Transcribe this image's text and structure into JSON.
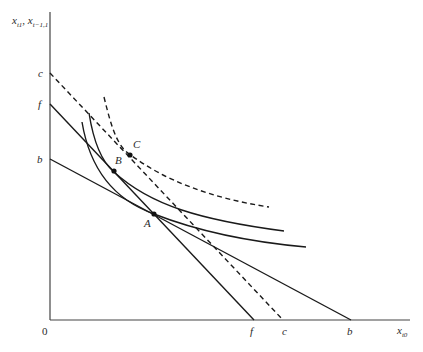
{
  "diagram": {
    "type": "economics-indifference-budget",
    "y_axis_label": {
      "main": "x",
      "sub1": "t1",
      "sep": ", ",
      "main2": "x",
      "sub2": "t−1,1"
    },
    "x_axis_label": {
      "main": "x",
      "sub": "t0"
    },
    "origin_label": "0",
    "y_intercepts": [
      {
        "label": "c",
        "style": "dashed"
      },
      {
        "label": "f",
        "style": "solid"
      },
      {
        "label": "b",
        "style": "solid"
      }
    ],
    "x_intercepts": [
      {
        "label": "f",
        "style": "solid"
      },
      {
        "label": "c",
        "style": "dashed"
      },
      {
        "label": "b",
        "style": "solid"
      }
    ],
    "points": [
      {
        "label": "A"
      },
      {
        "label": "B"
      },
      {
        "label": "C"
      }
    ],
    "lines": [
      {
        "name": "budget-line-cc",
        "from": "c",
        "to": "c",
        "style": "dashed"
      },
      {
        "name": "budget-line-ff",
        "from": "f",
        "to": "f",
        "style": "solid"
      },
      {
        "name": "budget-line-bb",
        "from": "b",
        "to": "b",
        "style": "solid"
      }
    ],
    "curves": [
      {
        "name": "indifference-curve-upper",
        "style": "dashed",
        "tangent_point": "C"
      },
      {
        "name": "indifference-curve-middle",
        "style": "solid",
        "tangent_point": "B"
      },
      {
        "name": "indifference-curve-lower",
        "style": "solid",
        "tangent_point": "A"
      }
    ]
  }
}
